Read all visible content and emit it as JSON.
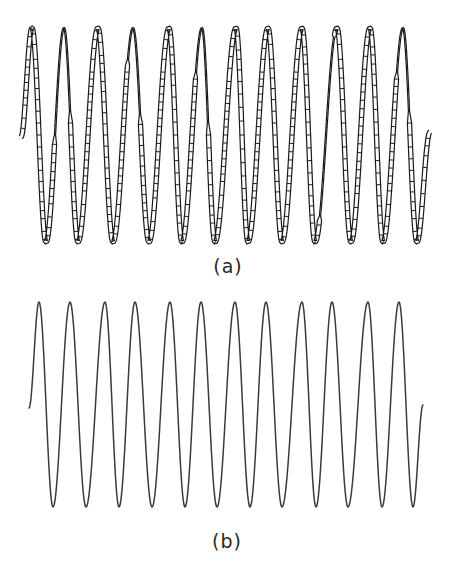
{
  "figure": {
    "panels": [
      {
        "id": "a",
        "label": "(a)",
        "description": "Ribbon (ladder) representation of a sinusoidal strand",
        "style": "ribbon",
        "peaks": 12,
        "troughs": 12,
        "color": "#1a1a1a"
      },
      {
        "id": "b",
        "label": "(b)",
        "description": "Single-line sinusoidal curve",
        "style": "line",
        "peaks": 12,
        "troughs": 12,
        "color": "#3a3a3a"
      }
    ]
  }
}
